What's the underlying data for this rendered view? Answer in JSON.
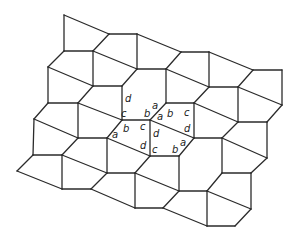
{
  "diagram": {
    "type": "pentagonal-tiling",
    "stroke_color": "#2b2b2b",
    "background": "#ffffff",
    "vertices": {
      "A1": [
        64,
        15
      ],
      "A2": [
        109,
        34
      ],
      "A3": [
        137,
        34
      ],
      "A4": [
        64,
        51
      ],
      "A5": [
        93,
        51
      ],
      "A6": [
        48,
        67
      ],
      "A7": [
        137,
        69
      ],
      "A8": [
        93,
        86
      ],
      "A9": [
        122,
        86
      ],
      "B1": [
        181,
        52
      ],
      "B2": [
        209,
        52
      ],
      "B3": [
        253,
        70
      ],
      "B4": [
        166,
        69
      ],
      "B5": [
        209,
        87
      ],
      "B6": [
        238,
        87
      ],
      "B7": [
        166,
        103
      ],
      "B8": [
        194,
        103
      ],
      "B9": [
        282,
        70
      ],
      "B10": [
        282,
        105
      ],
      "B11": [
        238,
        122
      ],
      "B12": [
        267,
        122
      ],
      "C1": [
        48,
        103
      ],
      "C2": [
        78,
        103
      ],
      "C3": [
        122,
        120
      ],
      "C4": [
        34,
        119
      ],
      "C5": [
        78,
        138
      ],
      "C6": [
        107,
        138
      ],
      "C7": [
        33,
        155
      ],
      "C8": [
        62,
        155
      ],
      "C9": [
        150,
        120
      ],
      "C10": [
        194,
        138
      ],
      "D1": [
        17,
        171
      ],
      "D2": [
        107,
        173
      ],
      "D3": [
        135,
        173
      ],
      "D4": [
        62,
        189
      ],
      "D5": [
        91,
        189
      ],
      "D6": [
        135,
        208
      ],
      "D7": [
        150,
        156
      ],
      "D8": [
        179,
        156
      ],
      "D9": [
        222,
        138
      ],
      "D10": [
        267,
        158
      ],
      "D11": [
        222,
        173
      ],
      "D12": [
        251,
        173
      ],
      "D13": [
        179,
        191
      ],
      "D14": [
        207,
        191
      ],
      "D15": [
        163,
        208
      ],
      "D16": [
        207,
        226
      ],
      "D17": [
        235,
        226
      ],
      "D18": [
        251,
        209
      ]
    },
    "edges": [
      [
        "A1",
        "A4"
      ],
      [
        "A1",
        "A2"
      ],
      [
        "A2",
        "A3"
      ],
      [
        "A3",
        "A7"
      ],
      [
        "A2",
        "A5"
      ],
      [
        "A4",
        "A5"
      ],
      [
        "A5",
        "A7"
      ],
      [
        "A7",
        "B4"
      ],
      [
        "A3",
        "B1"
      ],
      [
        "B1",
        "B2"
      ],
      [
        "B1",
        "B4"
      ],
      [
        "B2",
        "B5"
      ],
      [
        "B2",
        "B3"
      ],
      [
        "B3",
        "B9"
      ],
      [
        "B9",
        "B10"
      ],
      [
        "B3",
        "B6"
      ],
      [
        "B4",
        "B5"
      ],
      [
        "B5",
        "B6"
      ],
      [
        "B6",
        "B11"
      ],
      [
        "B6",
        "B10"
      ],
      [
        "B10",
        "B12"
      ],
      [
        "B11",
        "B12"
      ],
      [
        "B12",
        "D10"
      ],
      [
        "B11",
        "D9"
      ],
      [
        "A4",
        "A6"
      ],
      [
        "A6",
        "C1"
      ],
      [
        "A6",
        "A8"
      ],
      [
        "A5",
        "A8"
      ],
      [
        "A8",
        "A9"
      ],
      [
        "A9",
        "A7"
      ],
      [
        "A9",
        "C3"
      ],
      [
        "A8",
        "C2"
      ],
      [
        "C1",
        "C2"
      ],
      [
        "C2",
        "C5"
      ],
      [
        "C2",
        "C3"
      ],
      [
        "C3",
        "C9"
      ],
      [
        "C9",
        "B7"
      ],
      [
        "B7",
        "B4"
      ],
      [
        "B7",
        "B8"
      ],
      [
        "B8",
        "B5"
      ],
      [
        "B8",
        "C10"
      ],
      [
        "C9",
        "C10"
      ],
      [
        "B8",
        "B11"
      ],
      [
        "C10",
        "D9"
      ],
      [
        "D9",
        "D11"
      ],
      [
        "D9",
        "D10"
      ],
      [
        "C10",
        "D8"
      ],
      [
        "C1",
        "C4"
      ],
      [
        "C4",
        "C7"
      ],
      [
        "C4",
        "C5"
      ],
      [
        "C5",
        "C6"
      ],
      [
        "C6",
        "C3"
      ],
      [
        "C6",
        "D2"
      ],
      [
        "C5",
        "C8"
      ],
      [
        "C7",
        "C8"
      ],
      [
        "C7",
        "D1"
      ],
      [
        "D1",
        "D4"
      ],
      [
        "C8",
        "D4"
      ],
      [
        "C8",
        "D2"
      ],
      [
        "D2",
        "D3"
      ],
      [
        "D3",
        "D7"
      ],
      [
        "D3",
        "D6"
      ],
      [
        "D4",
        "D5"
      ],
      [
        "D5",
        "D2"
      ],
      [
        "D5",
        "D6"
      ],
      [
        "D6",
        "D15"
      ],
      [
        "C6",
        "D7"
      ],
      [
        "C9",
        "D7"
      ],
      [
        "D7",
        "D8"
      ],
      [
        "D8",
        "D13"
      ],
      [
        "D3",
        "D13"
      ],
      [
        "D13",
        "D14"
      ],
      [
        "D14",
        "D11"
      ],
      [
        "D11",
        "D12"
      ],
      [
        "D12",
        "D10"
      ],
      [
        "D14",
        "D16"
      ],
      [
        "D13",
        "D15"
      ],
      [
        "D15",
        "D16"
      ],
      [
        "D16",
        "D17"
      ],
      [
        "D17",
        "D18"
      ],
      [
        "D14",
        "D18"
      ],
      [
        "D12",
        "D18"
      ]
    ],
    "labels": [
      {
        "text": "d",
        "x": 125,
        "y": 102
      },
      {
        "text": "a",
        "x": 152,
        "y": 109
      },
      {
        "text": "c",
        "x": 121,
        "y": 117
      },
      {
        "text": "b",
        "x": 144,
        "y": 117
      },
      {
        "text": "a",
        "x": 157,
        "y": 120
      },
      {
        "text": "b",
        "x": 167,
        "y": 117
      },
      {
        "text": "c",
        "x": 184,
        "y": 116
      },
      {
        "text": "a",
        "x": 112,
        "y": 138
      },
      {
        "text": "b",
        "x": 123,
        "y": 132
      },
      {
        "text": "c",
        "x": 140,
        "y": 130
      },
      {
        "text": "d",
        "x": 153,
        "y": 137
      },
      {
        "text": "d",
        "x": 184,
        "y": 132
      },
      {
        "text": "a",
        "x": 180,
        "y": 146
      },
      {
        "text": "d",
        "x": 140,
        "y": 149
      },
      {
        "text": "c",
        "x": 152,
        "y": 153
      },
      {
        "text": "b",
        "x": 172,
        "y": 153
      }
    ]
  }
}
